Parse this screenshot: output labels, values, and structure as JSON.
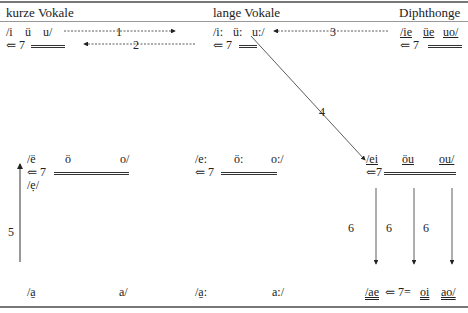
{
  "headers": {
    "short": "kurze Vokale",
    "long": "lange Vokale",
    "diph": "Diphthonge"
  },
  "row1": {
    "short": {
      "v1": "/i",
      "v2": "ü",
      "v3": "u/",
      "arrow_label": "⇐ 7"
    },
    "long": {
      "v1": "/i:",
      "v2": "ü:",
      "v3": "u:/",
      "arrow_label": "⇐ 7"
    },
    "diph": {
      "v1": "/ie",
      "v2": "üe",
      "v3": "uo/",
      "arrow_label": "⇐ 7"
    }
  },
  "row2": {
    "short": {
      "v1": "/ë",
      "v2": "ö",
      "v3": "o/",
      "arrow_label": "⇐ 7",
      "extra": "/ẹ/"
    },
    "long": {
      "v1": "/e:",
      "v2": "ö:",
      "v3": "o:/",
      "arrow_label": "⇐ 7"
    },
    "diph": {
      "v1": "/ei",
      "v2": "öu",
      "v3": "ou/",
      "arrow_label": "⇐7"
    }
  },
  "row3": {
    "short": {
      "v1": "/a̱",
      "v3": "a/"
    },
    "long": {
      "v1": "/a̱:",
      "v3": "a:/"
    },
    "diph": {
      "v1": "/ae",
      "arrow_label": "⇐ 7=",
      "v2": "oi",
      "v3": "ao/"
    }
  },
  "labels": {
    "n1": "1",
    "n2": "2",
    "n3": "3",
    "n4": "4",
    "n5": "5",
    "n6a": "6",
    "n6b": "6",
    "n6c": "6"
  }
}
